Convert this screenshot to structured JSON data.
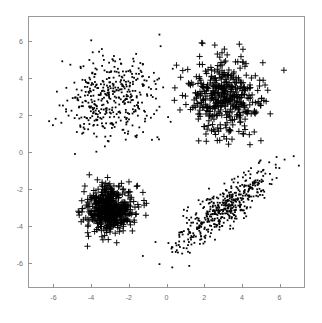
{
  "figure": {
    "title": "",
    "background_color": "#ffffff",
    "frame_color": "#9a9a9a",
    "tick_color": "#6e6e6e",
    "marker_color": "#000000"
  },
  "chart_data": {
    "type": "scatter",
    "title": "",
    "xlabel": "",
    "ylabel": "",
    "xlim": [
      -7.35,
      7.35
    ],
    "ylim": [
      -7.35,
      7.35
    ],
    "xticks": [
      -6,
      -4,
      -2,
      0,
      2,
      4,
      6
    ],
    "yticks": [
      -6,
      -4,
      -2,
      0,
      2,
      4,
      6
    ],
    "xtick_labels": [
      "-6",
      "-4",
      "-2",
      "0",
      "2",
      "4",
      "6"
    ],
    "ytick_labels": [
      "-6",
      "-4",
      "-2",
      "0",
      "2",
      "4",
      "6"
    ],
    "grid": false,
    "legend": null,
    "series": [
      {
        "name": "cluster-upper-left",
        "marker": "dot",
        "color": "#000000",
        "count": 420,
        "center": [
          -3.0,
          3.0
        ],
        "spread": [
          1.15,
          1.1
        ],
        "correlation": 0.0,
        "seed": 11
      },
      {
        "name": "cluster-upper-right",
        "marker": "plus",
        "color": "#000000",
        "count": 430,
        "center": [
          3.0,
          3.0
        ],
        "spread": [
          1.0,
          1.0
        ],
        "correlation": 0.0,
        "seed": 23
      },
      {
        "name": "cluster-lower-left",
        "marker": "plus",
        "color": "#000000",
        "count": 520,
        "center": [
          -3.0,
          -3.1
        ],
        "spread": [
          0.62,
          0.62
        ],
        "correlation": 0.0,
        "seed": 37
      },
      {
        "name": "cluster-lower-right",
        "marker": "dot",
        "color": "#000000",
        "count": 470,
        "center": [
          3.0,
          -3.1
        ],
        "spread": [
          1.25,
          1.05
        ],
        "correlation": 0.82,
        "seed": 53
      }
    ]
  }
}
